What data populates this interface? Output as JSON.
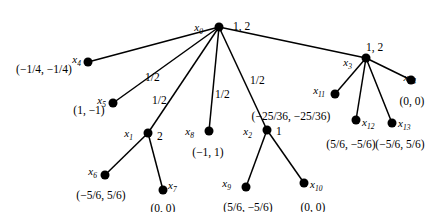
{
  "figure": {
    "type": "tree-diagram",
    "width": 438,
    "height": 212,
    "background": "#ffffff",
    "stroke_color": "#000000",
    "node_color": "#000000"
  },
  "nodes": [
    {
      "key": "x0",
      "id": "x",
      "sub": "0",
      "x": 219,
      "y": 27,
      "state": "1, 2",
      "coord": ""
    },
    {
      "key": "x4",
      "id": "x",
      "sub": "4",
      "x": 88,
      "y": 62,
      "state": "",
      "coord": "(−1/4, −1/4)"
    },
    {
      "key": "x5",
      "id": "x",
      "sub": "5",
      "x": 113,
      "y": 103,
      "state": "",
      "coord": "(1, −1)"
    },
    {
      "key": "x1",
      "id": "x",
      "sub": "1",
      "x": 148,
      "y": 133,
      "state": "2",
      "coord": ""
    },
    {
      "key": "x6",
      "id": "x",
      "sub": "6",
      "x": 105,
      "y": 175,
      "state": "",
      "coord": "(−5/6, 5/6)"
    },
    {
      "key": "x7",
      "id": "x",
      "sub": "7",
      "x": 163,
      "y": 190,
      "state": "",
      "coord": "(0, 0)"
    },
    {
      "key": "x8",
      "id": "x",
      "sub": "8",
      "x": 209,
      "y": 131,
      "state": "",
      "coord": "(−1, 1)"
    },
    {
      "key": "x2",
      "id": "x",
      "sub": "2",
      "x": 267,
      "y": 130,
      "state": "1",
      "coord": "(−25/36, −25/36)"
    },
    {
      "key": "x9",
      "id": "x",
      "sub": "9",
      "x": 246,
      "y": 187,
      "state": "",
      "coord": "(5/6, −5/6)"
    },
    {
      "key": "x10",
      "id": "x",
      "sub": "10",
      "x": 304,
      "y": 183,
      "state": "",
      "coord": "(0, 0)"
    },
    {
      "key": "x3",
      "id": "x",
      "sub": "3",
      "x": 366,
      "y": 58,
      "state": "1, 2",
      "coord": ""
    },
    {
      "key": "x11",
      "id": "x",
      "sub": "11",
      "x": 335,
      "y": 94,
      "state": "",
      "coord": ""
    },
    {
      "key": "x12",
      "id": "x",
      "sub": "12",
      "x": 356,
      "y": 120,
      "state": "",
      "coord": "(5/6, −5/6)"
    },
    {
      "key": "x13",
      "id": "x",
      "sub": "13",
      "x": 392,
      "y": 123,
      "state": "",
      "coord": "(−5/6, 5/6)"
    },
    {
      "key": "x14",
      "id": "x",
      "sub": "14",
      "x": 411,
      "y": 80,
      "state": "",
      "coord": "(0, 0)"
    }
  ],
  "edges": [
    {
      "from": "x0",
      "to": "x4",
      "label": ""
    },
    {
      "from": "x0",
      "to": "x5",
      "label": "1/2"
    },
    {
      "from": "x0",
      "to": "x1",
      "label": "1/2"
    },
    {
      "from": "x0",
      "to": "x8",
      "label": "1/2"
    },
    {
      "from": "x0",
      "to": "x2",
      "label": "1/2"
    },
    {
      "from": "x0",
      "to": "x3",
      "label": ""
    },
    {
      "from": "x1",
      "to": "x6",
      "label": ""
    },
    {
      "from": "x1",
      "to": "x7",
      "label": ""
    },
    {
      "from": "x2",
      "to": "x9",
      "label": ""
    },
    {
      "from": "x2",
      "to": "x10",
      "label": ""
    },
    {
      "from": "x3",
      "to": "x11",
      "label": ""
    },
    {
      "from": "x3",
      "to": "x12",
      "label": ""
    },
    {
      "from": "x3",
      "to": "x13",
      "label": ""
    },
    {
      "from": "x3",
      "to": "x14",
      "label": ""
    }
  ],
  "edge_labels": [
    {
      "text": "1/2",
      "x": 145,
      "y": 72
    },
    {
      "text": "1/2",
      "x": 152,
      "y": 95
    },
    {
      "text": "1/2",
      "x": 215,
      "y": 89
    },
    {
      "text": "1/2",
      "x": 250,
      "y": 75
    }
  ],
  "node_id_labels": [
    {
      "key": "x0",
      "text_x": 203,
      "text_y": 22,
      "align": "right"
    },
    {
      "key": "x4",
      "text_x": 81,
      "text_y": 54,
      "align": "right"
    },
    {
      "key": "x5",
      "text_x": 106,
      "text_y": 95,
      "align": "right"
    },
    {
      "key": "x1",
      "text_x": 133,
      "text_y": 128,
      "align": "right"
    },
    {
      "key": "x6",
      "text_x": 97,
      "text_y": 166,
      "align": "right"
    },
    {
      "key": "x7",
      "text_x": 168,
      "text_y": 180,
      "align": "left"
    },
    {
      "key": "x8",
      "text_x": 194,
      "text_y": 126,
      "align": "right"
    },
    {
      "key": "x2",
      "text_x": 252,
      "text_y": 126,
      "align": "right"
    },
    {
      "key": "x9",
      "text_x": 231,
      "text_y": 178,
      "align": "right"
    },
    {
      "key": "x10",
      "text_x": 310,
      "text_y": 179,
      "align": "left"
    },
    {
      "key": "x3",
      "text_x": 352,
      "text_y": 57,
      "align": "right"
    },
    {
      "key": "x11",
      "text_x": 325,
      "text_y": 85,
      "align": "right"
    },
    {
      "key": "x12",
      "text_x": 362,
      "text_y": 117,
      "align": "left"
    },
    {
      "key": "x13",
      "text_x": 398,
      "text_y": 118,
      "align": "left"
    },
    {
      "key": "x14",
      "text_x": 416,
      "text_y": 72,
      "align": "right"
    }
  ],
  "state_labels": [
    {
      "key": "x0",
      "text": "1, 2",
      "x": 233,
      "y": 21
    },
    {
      "key": "x1",
      "text": "2",
      "x": 157,
      "y": 131
    },
    {
      "key": "x2",
      "text": "1",
      "x": 276,
      "y": 126
    },
    {
      "key": "x3",
      "text": "1, 2",
      "x": 366,
      "y": 42
    }
  ],
  "coord_labels": [
    {
      "key": "x4",
      "text": "(−1/4, −1/4)",
      "x": 44,
      "y": 64
    },
    {
      "key": "x5",
      "text": "(1, −1)",
      "x": 89,
      "y": 105
    },
    {
      "key": "x6",
      "text": "(−5/6, 5/6)",
      "x": 101,
      "y": 190
    },
    {
      "key": "x7",
      "text": "(0, 0)",
      "x": 163,
      "y": 203
    },
    {
      "key": "x8",
      "text": "(−1, 1)",
      "x": 208,
      "y": 147
    },
    {
      "key": "x2",
      "text": "(−25/36, −25/36)",
      "x": 291,
      "y": 111
    },
    {
      "key": "x9",
      "text": "(5/6, −5/6)",
      "x": 248,
      "y": 202
    },
    {
      "key": "x10",
      "text": "(0, 0)",
      "x": 313,
      "y": 202
    },
    {
      "key": "x12",
      "text": "(5/6, −5/6)",
      "x": 351,
      "y": 139
    },
    {
      "key": "x13",
      "text": "(−5/6, 5/6)",
      "x": 400,
      "y": 139
    },
    {
      "key": "x14",
      "text": "(0, 0)",
      "x": 412,
      "y": 96
    }
  ]
}
